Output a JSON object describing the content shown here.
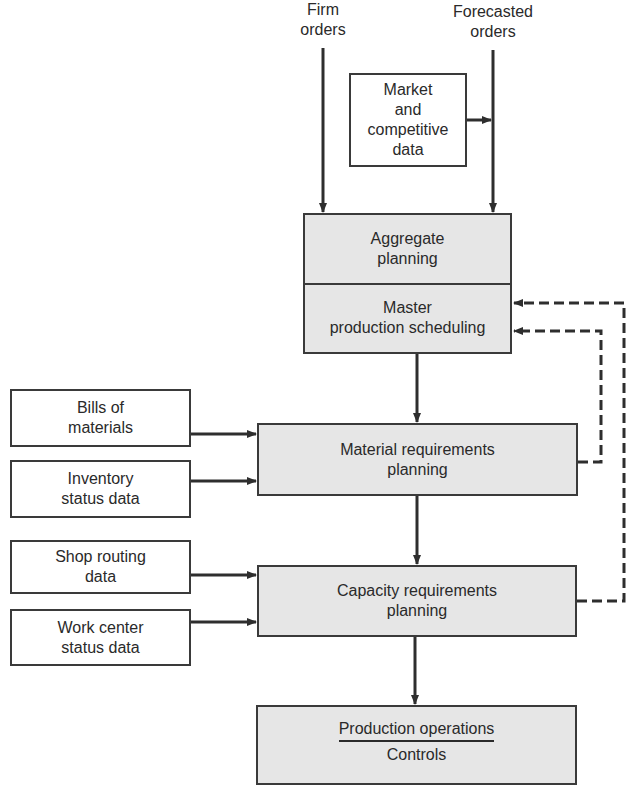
{
  "inputs_top": {
    "firm_orders": [
      "Firm",
      "orders"
    ],
    "forecasted_orders": [
      "Forecasted",
      "orders"
    ],
    "market_data": [
      "Market",
      "and",
      "competitive",
      "data"
    ]
  },
  "planning": {
    "aggregate": [
      "Aggregate",
      "planning"
    ],
    "master": [
      "Master",
      "production scheduling"
    ]
  },
  "mrp_inputs": {
    "bills": [
      "Bills of",
      "materials"
    ],
    "inventory": [
      "Inventory",
      "status data"
    ]
  },
  "mrp": [
    "Material requirements",
    "planning"
  ],
  "crp_inputs": {
    "shop_routing": [
      "Shop routing",
      "data"
    ],
    "work_center": [
      "Work center",
      "status data"
    ]
  },
  "crp": [
    "Capacity requirements",
    "planning"
  ],
  "production": {
    "title": "Production operations",
    "subtitle": "Controls"
  },
  "colors": {
    "line": "#2e2e2e",
    "process_fill": "#e6e6e6",
    "input_fill": "#ffffff"
  }
}
